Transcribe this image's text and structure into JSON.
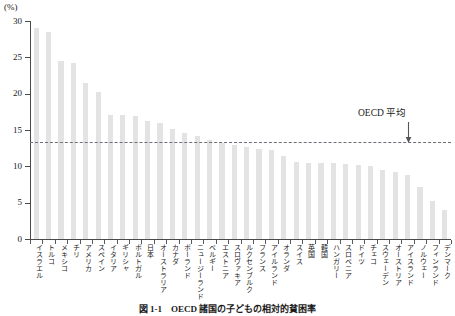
{
  "figure": {
    "y_unit_label": "(%)",
    "caption": "図 1-1　OECD 諸国の子どもの相対的貧困率",
    "annotation": {
      "label": "OECD 平均",
      "value": 13.3,
      "arrow_icon": "down-arrow-icon"
    }
  },
  "chart_data": {
    "type": "bar",
    "title": "図 1-1　OECD 諸国の子どもの相対的貧困率",
    "xlabel": "",
    "ylabel": "(%)",
    "ylim": [
      0,
      30
    ],
    "yticks": [
      0,
      5,
      10,
      15,
      20,
      25,
      30
    ],
    "ytick_labels": [
      "0",
      "5",
      "10",
      "15",
      "20",
      "25",
      "30"
    ],
    "grid": false,
    "legend": false,
    "bar_color": "#e3e3e3",
    "reference_line": {
      "label": "OECD 平均",
      "value": 13.3,
      "style": "dashed",
      "color": "#6e6e78"
    },
    "categories": [
      "イスラエル",
      "トルコ",
      "メキシコ",
      "チリ",
      "アメリカ",
      "スペイン",
      "イタリア",
      "ギリシャ",
      "ポルトガル",
      "日本",
      "オーストラリア",
      "カナダ",
      "ポーランド",
      "ニュージーランド",
      "ベルギー",
      "エストニア",
      "スロヴァキア",
      "ルクセンブルク",
      "フランス",
      "アイルランド",
      "オランダ",
      "スイス",
      "英国",
      "韓国",
      "ハンガリー",
      "スロベニア",
      "ドイツ",
      "チェコ",
      "スウェーデン",
      "オーストリア",
      "アイスランド",
      "ノルウェー",
      "フィンランド",
      "デンマーク"
    ],
    "values": [
      29.0,
      28.5,
      24.5,
      24.2,
      21.5,
      20.3,
      17.1,
      17.0,
      16.9,
      16.3,
      15.9,
      15.1,
      14.6,
      14.2,
      13.6,
      13.2,
      13.0,
      12.6,
      12.4,
      12.3,
      11.4,
      10.6,
      10.5,
      10.5,
      10.4,
      10.3,
      10.2,
      10.1,
      9.5,
      9.2,
      8.8,
      7.2,
      5.2,
      4.0
    ]
  }
}
